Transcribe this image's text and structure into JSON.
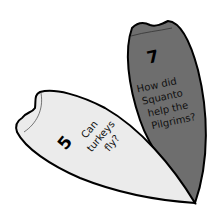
{
  "cards": [
    {
      "number": "7",
      "lines": [
        "How did",
        "Squanto",
        "help the",
        "Pilgrims?"
      ],
      "fill": "#6e6e6e"
    },
    {
      "number": "5",
      "lines": [
        "Can",
        "turkeys",
        "fly?"
      ],
      "fill": "#ebebeb"
    }
  ],
  "colors": {
    "outline": "#000000",
    "background": "#ffffff"
  }
}
